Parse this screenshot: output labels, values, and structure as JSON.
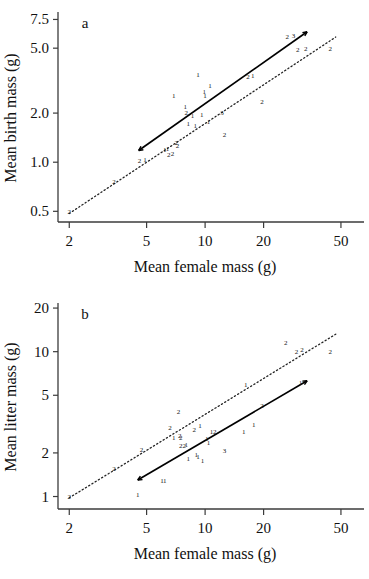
{
  "figure": {
    "background": "#ffffff",
    "ink": "#111111",
    "panels": [
      "a",
      "b"
    ]
  },
  "chart_data": [
    {
      "type": "scatter",
      "panel_label": "a",
      "title": "",
      "xlabel": "Mean female mass (g)",
      "ylabel": "Mean birth mass (g)",
      "xscale": "log",
      "yscale": "log",
      "xlim": [
        1.75,
        57
      ],
      "ylim": [
        0.43,
        8.1
      ],
      "xticks": [
        2,
        5,
        10,
        20,
        50
      ],
      "xticklabels": [
        "2",
        "5",
        "10",
        "20",
        "50"
      ],
      "yticks": [
        0.5,
        1.0,
        2.0,
        5.0,
        7.5
      ],
      "yticklabels": [
        "0.5",
        "1.0",
        "2.0",
        "5.0",
        "7.5"
      ],
      "grid": false,
      "legend": "none",
      "point_marker": "numeric-count-label",
      "points": [
        {
          "x": 2.0,
          "y": 0.5,
          "label": "2"
        },
        {
          "x": 3.4,
          "y": 0.76,
          "label": "2"
        },
        {
          "x": 4.6,
          "y": 1.02,
          "label": "2"
        },
        {
          "x": 4.9,
          "y": 1.04,
          "label": "1"
        },
        {
          "x": 6.2,
          "y": 1.2,
          "label": "1"
        },
        {
          "x": 6.4,
          "y": 1.22,
          "label": "1"
        },
        {
          "x": 6.5,
          "y": 1.12,
          "label": "2"
        },
        {
          "x": 6.8,
          "y": 1.13,
          "label": "2"
        },
        {
          "x": 6.9,
          "y": 2.55,
          "label": "1"
        },
        {
          "x": 7.1,
          "y": 1.32,
          "label": "2"
        },
        {
          "x": 7.2,
          "y": 1.27,
          "label": "2"
        },
        {
          "x": 7.9,
          "y": 2.2,
          "label": "1"
        },
        {
          "x": 8.0,
          "y": 2.02,
          "label": "2"
        },
        {
          "x": 8.2,
          "y": 1.72,
          "label": "1"
        },
        {
          "x": 8.6,
          "y": 1.92,
          "label": "1"
        },
        {
          "x": 8.9,
          "y": 1.68,
          "label": "1"
        },
        {
          "x": 9.2,
          "y": 3.45,
          "label": "1"
        },
        {
          "x": 9.6,
          "y": 1.95,
          "label": "1"
        },
        {
          "x": 9.9,
          "y": 2.7,
          "label": "1"
        },
        {
          "x": 10.0,
          "y": 2.58,
          "label": "1"
        },
        {
          "x": 10.4,
          "y": 1.78,
          "label": "1"
        },
        {
          "x": 10.6,
          "y": 2.95,
          "label": "1"
        },
        {
          "x": 12.2,
          "y": 2.02,
          "label": "3"
        },
        {
          "x": 12.6,
          "y": 1.48,
          "label": "2"
        },
        {
          "x": 16.6,
          "y": 3.35,
          "label": "2"
        },
        {
          "x": 17.6,
          "y": 3.38,
          "label": "1"
        },
        {
          "x": 19.6,
          "y": 2.35,
          "label": "2"
        },
        {
          "x": 26.5,
          "y": 5.9,
          "label": "2"
        },
        {
          "x": 28.5,
          "y": 5.95,
          "label": "3"
        },
        {
          "x": 30.0,
          "y": 4.9,
          "label": "2"
        },
        {
          "x": 33.0,
          "y": 4.95,
          "label": "2"
        },
        {
          "x": 44.0,
          "y": 4.95,
          "label": "2"
        }
      ],
      "lines": [
        {
          "name": "fitted-regression",
          "style": "solid",
          "arrows": "both",
          "x": [
            4.55,
            33.5
          ],
          "y": [
            1.18,
            6.3
          ]
        },
        {
          "name": "reference-isometry",
          "style": "dotted",
          "arrows": "none",
          "x": [
            2.0,
            47.0
          ],
          "y": [
            0.485,
            5.85
          ]
        }
      ]
    },
    {
      "type": "scatter",
      "panel_label": "b",
      "title": "",
      "xlabel": "Mean female mass (g)",
      "ylabel": "Mean litter mass (g)",
      "xscale": "log",
      "yscale": "log",
      "xlim": [
        1.75,
        57
      ],
      "ylim": [
        0.82,
        21
      ],
      "xticks": [
        2,
        5,
        10,
        20,
        50
      ],
      "xticklabels": [
        "2",
        "5",
        "10",
        "20",
        "50"
      ],
      "yticks": [
        1,
        2,
        5,
        10,
        20
      ],
      "yticklabels": [
        "1",
        "2",
        "5",
        "10",
        "20"
      ],
      "grid": false,
      "legend": "none",
      "point_marker": "numeric-count-label",
      "points": [
        {
          "x": 2.0,
          "y": 1.0,
          "label": "2"
        },
        {
          "x": 3.4,
          "y": 1.56,
          "label": "2"
        },
        {
          "x": 4.5,
          "y": 1.03,
          "label": "1"
        },
        {
          "x": 4.7,
          "y": 2.1,
          "label": "2"
        },
        {
          "x": 6.0,
          "y": 1.28,
          "label": "1"
        },
        {
          "x": 6.2,
          "y": 1.28,
          "label": "1"
        },
        {
          "x": 6.6,
          "y": 3.0,
          "label": "2"
        },
        {
          "x": 6.9,
          "y": 2.55,
          "label": "1"
        },
        {
          "x": 7.3,
          "y": 3.85,
          "label": "2"
        },
        {
          "x": 7.4,
          "y": 2.62,
          "label": "2"
        },
        {
          "x": 7.5,
          "y": 2.55,
          "label": "2"
        },
        {
          "x": 7.5,
          "y": 2.26,
          "label": "2"
        },
        {
          "x": 7.8,
          "y": 2.26,
          "label": "2"
        },
        {
          "x": 8.0,
          "y": 2.3,
          "label": "1"
        },
        {
          "x": 8.2,
          "y": 1.82,
          "label": "1"
        },
        {
          "x": 8.8,
          "y": 2.9,
          "label": "2"
        },
        {
          "x": 9.0,
          "y": 1.95,
          "label": "1"
        },
        {
          "x": 9.2,
          "y": 1.88,
          "label": "1"
        },
        {
          "x": 9.4,
          "y": 3.1,
          "label": "1"
        },
        {
          "x": 9.7,
          "y": 1.78,
          "label": "1"
        },
        {
          "x": 10.2,
          "y": 2.5,
          "label": "1"
        },
        {
          "x": 10.4,
          "y": 2.35,
          "label": "1"
        },
        {
          "x": 10.8,
          "y": 2.8,
          "label": "1"
        },
        {
          "x": 11.2,
          "y": 2.82,
          "label": "2"
        },
        {
          "x": 12.6,
          "y": 2.08,
          "label": "3"
        },
        {
          "x": 15.8,
          "y": 2.8,
          "label": "1"
        },
        {
          "x": 16.2,
          "y": 5.9,
          "label": "1"
        },
        {
          "x": 17.8,
          "y": 3.15,
          "label": "1"
        },
        {
          "x": 19.6,
          "y": 4.25,
          "label": "2"
        },
        {
          "x": 26.0,
          "y": 11.5,
          "label": "2"
        },
        {
          "x": 29.5,
          "y": 10.1,
          "label": "2"
        },
        {
          "x": 31.5,
          "y": 10.3,
          "label": "2"
        },
        {
          "x": 31.0,
          "y": 6.1,
          "label": "1"
        },
        {
          "x": 44.0,
          "y": 9.95,
          "label": "2"
        }
      ],
      "lines": [
        {
          "name": "fitted-regression",
          "style": "solid",
          "arrows": "both",
          "x": [
            4.5,
            33.5
          ],
          "y": [
            1.3,
            6.3
          ]
        },
        {
          "name": "reference-isometry",
          "style": "dotted",
          "arrows": "none",
          "x": [
            2.0,
            47.0
          ],
          "y": [
            0.98,
            13.2
          ]
        }
      ]
    }
  ]
}
